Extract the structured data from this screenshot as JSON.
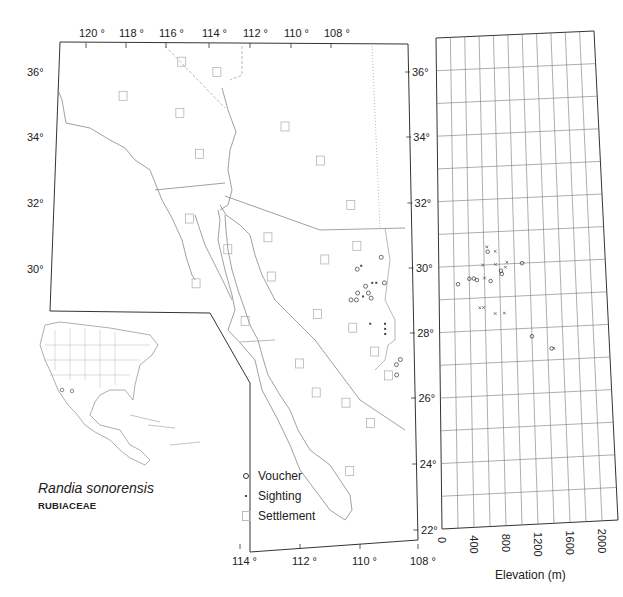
{
  "title": {
    "species": "Randia sonorensis",
    "family": "RUBIACEAE"
  },
  "legend": [
    {
      "symbol": "voucher-circle",
      "label": "Voucher"
    },
    {
      "symbol": "sighting-dot",
      "label": "Sighting"
    },
    {
      "symbol": "settlement-square",
      "label": "Settlement"
    }
  ],
  "map": {
    "top_longitude_labels": [
      "120 °",
      "118 °",
      "116 °",
      "114 °",
      "112 °",
      "110 °",
      "108 °"
    ],
    "bottom_longitude_labels": [
      "114 °",
      "112 °",
      "110 °",
      "108 °"
    ],
    "left_latitude_labels": [
      "36°",
      "34°",
      "32°",
      "30°"
    ],
    "right_latitude_labels": [
      "36°",
      "34°",
      "32°",
      "30°",
      "28°",
      "26°",
      "24°",
      "22°"
    ]
  },
  "elevation_axis": {
    "label": "Elevation (m)",
    "ticks": [
      "0",
      "400",
      "800",
      "1200",
      "1600",
      "2000"
    ]
  },
  "chart_data": [
    {
      "type": "scatter",
      "title": "Randia sonorensis distribution map",
      "xlabel": "Longitude (°W)",
      "ylabel": "Latitude (°N)",
      "xlim": [
        121,
        108
      ],
      "ylim": [
        22,
        37
      ],
      "x_tick_labels": [
        "120",
        "118",
        "116",
        "114",
        "112",
        "110",
        "108"
      ],
      "y_tick_labels": [
        "22",
        "24",
        "26",
        "28",
        "30",
        "32",
        "34",
        "36"
      ],
      "grid": false,
      "legend_position": "lower-left inside",
      "series": [
        {
          "name": "Voucher",
          "points": [
            {
              "lon": 109.1,
              "lat": 30.45
            },
            {
              "lon": 110.0,
              "lat": 30.1
            },
            {
              "lon": 109.0,
              "lat": 29.7
            },
            {
              "lon": 110.25,
              "lat": 29.2
            },
            {
              "lon": 110.05,
              "lat": 29.2
            },
            {
              "lon": 110.0,
              "lat": 29.4
            },
            {
              "lon": 109.6,
              "lat": 29.4
            },
            {
              "lon": 109.5,
              "lat": 29.25
            },
            {
              "lon": 109.7,
              "lat": 29.6
            },
            {
              "lon": 108.6,
              "lat": 27.3
            },
            {
              "lon": 108.45,
              "lat": 27.45
            },
            {
              "lon": 108.6,
              "lat": 27.0
            }
          ]
        },
        {
          "name": "Sighting",
          "points": [
            {
              "lon": 109.85,
              "lat": 30.2
            },
            {
              "lon": 109.45,
              "lat": 29.7
            },
            {
              "lon": 109.3,
              "lat": 29.7
            },
            {
              "lon": 109.8,
              "lat": 29.3
            },
            {
              "lon": 109.55,
              "lat": 28.5
            },
            {
              "lon": 109.0,
              "lat": 28.5
            },
            {
              "lon": 109.0,
              "lat": 28.35
            },
            {
              "lon": 109.0,
              "lat": 28.2
            }
          ]
        },
        {
          "name": "Settlement",
          "points": [
            {
              "lon": 116.4,
              "lat": 36.2
            },
            {
              "lon": 115.1,
              "lat": 35.9
            },
            {
              "lon": 118.6,
              "lat": 35.2
            },
            {
              "lon": 116.5,
              "lat": 34.7
            },
            {
              "lon": 112.6,
              "lat": 34.3
            },
            {
              "lon": 115.8,
              "lat": 33.5
            },
            {
              "lon": 111.3,
              "lat": 33.3
            },
            {
              "lon": 110.2,
              "lat": 32.0
            },
            {
              "lon": 116.2,
              "lat": 31.6
            },
            {
              "lon": 113.3,
              "lat": 31.05
            },
            {
              "lon": 114.8,
              "lat": 30.7
            },
            {
              "lon": 111.2,
              "lat": 30.4
            },
            {
              "lon": 110.0,
              "lat": 30.8
            },
            {
              "lon": 116.0,
              "lat": 29.7
            },
            {
              "lon": 113.2,
              "lat": 29.9
            },
            {
              "lon": 114.2,
              "lat": 28.6
            },
            {
              "lon": 111.5,
              "lat": 28.8
            },
            {
              "lon": 110.2,
              "lat": 28.4
            },
            {
              "lon": 109.4,
              "lat": 27.7
            },
            {
              "lon": 108.9,
              "lat": 27.0
            },
            {
              "lon": 112.2,
              "lat": 27.35
            },
            {
              "lon": 110.5,
              "lat": 26.2
            },
            {
              "lon": 111.6,
              "lat": 26.5
            },
            {
              "lon": 109.6,
              "lat": 25.6
            },
            {
              "lon": 110.4,
              "lat": 24.2
            }
          ]
        }
      ]
    },
    {
      "type": "scatter",
      "title": "Elevation vs latitude",
      "xlabel": "Elevation (m)",
      "ylabel": "Latitude (°N)",
      "xlim": [
        0,
        2000
      ],
      "ylim": [
        22,
        37
      ],
      "x_tick_labels": [
        "0",
        "400",
        "800",
        "1200",
        "1600",
        "2000"
      ],
      "grid": true,
      "series": [
        {
          "name": "Voucher",
          "points": [
            {
              "elev": 650,
              "lat": 30.4
            },
            {
              "elev": 1100,
              "lat": 30.0
            },
            {
              "elev": 820,
              "lat": 29.8
            },
            {
              "elev": 830,
              "lat": 29.7
            },
            {
              "elev": 400,
              "lat": 29.6
            },
            {
              "elev": 460,
              "lat": 29.6
            },
            {
              "elev": 500,
              "lat": 29.55
            },
            {
              "elev": 680,
              "lat": 29.5
            },
            {
              "elev": 250,
              "lat": 29.45
            },
            {
              "elev": 1200,
              "lat": 27.75
            },
            {
              "elev": 1450,
              "lat": 27.35
            }
          ]
        },
        {
          "name": "Sighting",
          "points": [
            {
              "elev": 640,
              "lat": 30.55
            },
            {
              "elev": 750,
              "lat": 30.4
            },
            {
              "elev": 580,
              "lat": 30.0
            },
            {
              "elev": 750,
              "lat": 30.0
            },
            {
              "elev": 900,
              "lat": 30.05
            },
            {
              "elev": 880,
              "lat": 29.9
            },
            {
              "elev": 600,
              "lat": 29.6
            },
            {
              "elev": 530,
              "lat": 28.7
            },
            {
              "elev": 580,
              "lat": 28.7
            },
            {
              "elev": 730,
              "lat": 28.5
            },
            {
              "elev": 850,
              "lat": 28.5
            },
            {
              "elev": 1480,
              "lat": 27.35
            }
          ]
        }
      ]
    }
  ]
}
